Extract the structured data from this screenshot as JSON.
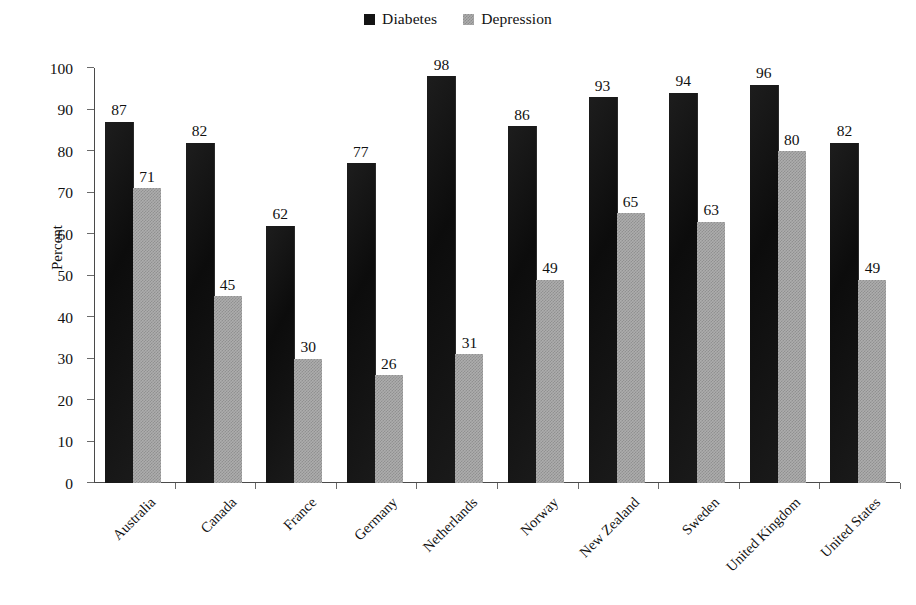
{
  "chart_data": {
    "type": "bar",
    "title": "",
    "subtitle": "",
    "xlabel": "",
    "ylabel": "Percent",
    "ylim": [
      0,
      100
    ],
    "ytick_step": 10,
    "yticks": [
      0,
      10,
      20,
      30,
      40,
      50,
      60,
      70,
      80,
      90,
      100
    ],
    "ytick_labels": [
      "0",
      "10",
      "20",
      "30",
      "40",
      "50",
      "60",
      "70",
      "80",
      "90",
      "100"
    ],
    "grid": false,
    "legend_position": "top-center",
    "categories": [
      "Australia",
      "Canada",
      "France",
      "Germany",
      "Netherlands",
      "Norway",
      "New Zealand",
      "Sweden",
      "United Kingdom",
      "United States"
    ],
    "series": [
      {
        "name": "Diabetes",
        "color": "#151515",
        "values": [
          87,
          82,
          62,
          77,
          98,
          86,
          93,
          94,
          96,
          82
        ],
        "value_labels": [
          "87",
          "82",
          "62",
          "77",
          "98",
          "86",
          "93",
          "94",
          "96",
          "82"
        ]
      },
      {
        "name": "Depression",
        "color": "#adadad",
        "values": [
          71,
          45,
          30,
          26,
          31,
          49,
          65,
          63,
          80,
          49
        ],
        "value_labels": [
          "71",
          "45",
          "30",
          "26",
          "31",
          "49",
          "65",
          "63",
          "80",
          "49"
        ]
      }
    ]
  },
  "legend": {
    "entries": [
      {
        "label": "Diabetes",
        "swatch": "series-diabetes"
      },
      {
        "label": "Depression",
        "swatch": "series-depression"
      }
    ]
  },
  "axes": {
    "y_title": "Percent"
  }
}
